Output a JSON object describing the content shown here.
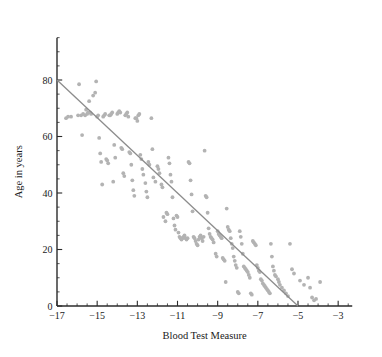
{
  "chart_data": {
    "type": "scatter",
    "title": "",
    "xlabel": "Blood Test Measure",
    "ylabel": "Age in years",
    "xlim": [
      -17.6,
      -2.3
    ],
    "ylim": [
      -1.5,
      95
    ],
    "grid": false,
    "legend": "none",
    "xticks": [
      -17,
      -15,
      -13,
      -11,
      -9,
      -7,
      -5,
      -3
    ],
    "xtick_labels": [
      "−17",
      "−15",
      "−13",
      "−11",
      "−9",
      "−7",
      "−5",
      "−3"
    ],
    "x_minor_step": 0.5,
    "yticks": [
      0,
      20,
      40,
      60,
      80
    ],
    "ytick_labels": [
      "0",
      "20",
      "40",
      "60",
      "80"
    ],
    "y_minor_step": 5,
    "point_color": "#b3b3b3",
    "point_radius": 1.9,
    "line_color": "#8c8c8c",
    "axis_color": "#2b2b2b",
    "fit_line": {
      "x1": -17,
      "y1": 80,
      "x2": -5,
      "y2": 0,
      "slope": -6.667,
      "intercept": -33.33
    },
    "x": [
      -16.55,
      -16.45,
      -16.3,
      -15.95,
      -15.9,
      -15.8,
      -15.75,
      -15.7,
      -15.6,
      -15.55,
      -15.5,
      -15.45,
      -15.4,
      -15.35,
      -15.3,
      -15.2,
      -15.1,
      -15.05,
      -15.0,
      -14.95,
      -14.9,
      -14.85,
      -14.8,
      -14.75,
      -14.7,
      -14.65,
      -14.6,
      -14.55,
      -14.5,
      -14.45,
      -14.4,
      -14.35,
      -14.3,
      -14.25,
      -14.2,
      -14.15,
      -14.1,
      -14.0,
      -13.95,
      -13.9,
      -13.85,
      -13.8,
      -13.75,
      -13.7,
      -13.65,
      -13.6,
      -13.55,
      -13.5,
      -13.45,
      -13.4,
      -13.35,
      -13.3,
      -13.25,
      -13.2,
      -13.15,
      -13.1,
      -13.05,
      -13.0,
      -12.95,
      -12.9,
      -12.85,
      -12.8,
      -12.75,
      -12.7,
      -12.6,
      -12.55,
      -12.5,
      -12.45,
      -12.4,
      -12.3,
      -12.25,
      -12.2,
      -12.1,
      -12.0,
      -11.95,
      -11.9,
      -11.8,
      -11.75,
      -11.7,
      -11.6,
      -11.55,
      -11.5,
      -11.45,
      -11.4,
      -11.35,
      -11.3,
      -11.25,
      -11.2,
      -11.15,
      -11.1,
      -11.05,
      -11.0,
      -10.95,
      -10.9,
      -10.85,
      -10.8,
      -10.75,
      -10.7,
      -10.65,
      -10.6,
      -10.55,
      -10.5,
      -10.45,
      -10.4,
      -10.35,
      -10.3,
      -10.25,
      -10.2,
      -10.15,
      -10.1,
      -10.05,
      -10.0,
      -9.95,
      -9.9,
      -9.85,
      -9.8,
      -9.75,
      -9.7,
      -9.65,
      -9.6,
      -9.55,
      -9.5,
      -9.45,
      -9.4,
      -9.35,
      -9.3,
      -9.25,
      -9.2,
      -9.1,
      -9.05,
      -9.0,
      -8.95,
      -8.9,
      -8.85,
      -8.8,
      -8.75,
      -8.7,
      -8.65,
      -8.6,
      -8.55,
      -8.5,
      -8.45,
      -8.4,
      -8.35,
      -8.3,
      -8.25,
      -8.2,
      -8.15,
      -8.1,
      -8.05,
      -8.0,
      -7.95,
      -7.9,
      -7.85,
      -7.8,
      -7.75,
      -7.7,
      -7.65,
      -7.6,
      -7.55,
      -7.5,
      -7.45,
      -7.4,
      -7.35,
      -7.3,
      -7.25,
      -7.2,
      -7.15,
      -7.1,
      -7.05,
      -7.0,
      -6.95,
      -6.9,
      -6.85,
      -6.8,
      -6.75,
      -6.7,
      -6.65,
      -6.6,
      -6.55,
      -6.5,
      -6.45,
      -6.4,
      -6.35,
      -6.3,
      -6.25,
      -6.2,
      -6.15,
      -6.1,
      -6.0,
      -5.95,
      -5.9,
      -5.8,
      -5.7,
      -5.6,
      -5.5,
      -5.4,
      -5.3,
      -5.2,
      -4.9,
      -4.7,
      -4.5,
      -4.4,
      -4.3,
      -4.2,
      -4.1,
      -3.9
    ],
    "y": [
      66.5,
      67.0,
      67.0,
      67.5,
      78.5,
      67.5,
      60.5,
      68.0,
      67.5,
      69.5,
      68.0,
      68.5,
      72.5,
      68.5,
      68.0,
      74.5,
      75.5,
      79.5,
      67.0,
      67.5,
      59.5,
      54.0,
      51.0,
      43.0,
      67.0,
      67.5,
      68.0,
      52.0,
      51.5,
      50.5,
      67.5,
      67.5,
      68.0,
      68.5,
      44.0,
      57.0,
      52.5,
      68.0,
      68.5,
      69.0,
      68.5,
      56.0,
      55.5,
      47.0,
      46.0,
      67.5,
      68.0,
      68.5,
      67.0,
      54.5,
      54.0,
      50.0,
      44.5,
      41.0,
      39.0,
      66.5,
      66.5,
      65.5,
      67.5,
      68.0,
      53.5,
      52.0,
      48.5,
      46.5,
      43.5,
      40.5,
      38.5,
      51.0,
      50.0,
      66.5,
      55.5,
      45.5,
      44.0,
      49.5,
      48.5,
      47.0,
      43.0,
      42.0,
      31.5,
      30.0,
      33.0,
      32.5,
      52.5,
      50.5,
      46.5,
      44.0,
      38.5,
      31.0,
      28.5,
      27.0,
      32.0,
      31.5,
      26.0,
      24.5,
      24.0,
      23.5,
      24.0,
      24.5,
      25.0,
      24.0,
      23.5,
      24.0,
      51.0,
      50.5,
      44.5,
      39.5,
      33.5,
      24.5,
      24.0,
      23.0,
      22.0,
      21.5,
      23.5,
      24.5,
      25.0,
      24.0,
      23.0,
      24.5,
      55.0,
      39.0,
      38.5,
      33.0,
      27.5,
      25.5,
      24.5,
      24.0,
      23.5,
      22.5,
      18.5,
      17.5,
      26.5,
      25.5,
      25.0,
      24.5,
      24.0,
      17.0,
      16.5,
      16.0,
      8.5,
      34.5,
      28.0,
      27.0,
      26.5,
      24.0,
      22.0,
      20.5,
      17.5,
      16.0,
      14.5,
      13.5,
      5.0,
      4.5,
      26.5,
      24.5,
      22.0,
      18.5,
      14.0,
      13.5,
      13.0,
      12.5,
      12.0,
      11.0,
      10.0,
      4.5,
      4.0,
      23.0,
      22.5,
      22.0,
      21.5,
      14.5,
      13.5,
      12.5,
      12.0,
      9.5,
      9.0,
      8.0,
      7.5,
      7.0,
      6.5,
      6.0,
      5.5,
      5.0,
      4.5,
      22.0,
      17.5,
      14.0,
      12.5,
      11.0,
      10.5,
      9.5,
      8.5,
      7.5,
      6.5,
      5.5,
      4.5,
      3.5,
      22.0,
      13.0,
      11.5,
      9.0,
      7.5,
      10.0,
      6.5,
      3.0,
      2.0,
      2.5,
      8.5,
      10.5,
      6.5,
      6.0,
      5.5,
      7.0
    ]
  }
}
